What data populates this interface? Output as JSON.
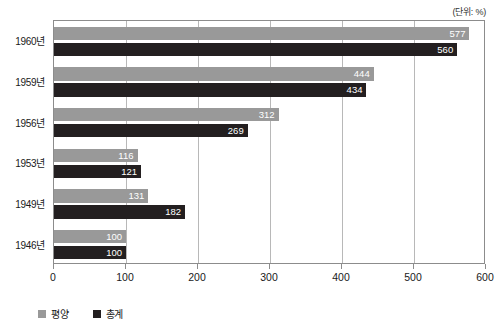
{
  "chart_data": {
    "type": "bar",
    "orientation": "horizontal",
    "title": "",
    "unit_note": "(단위: %)",
    "xlabel": "",
    "ylabel": "",
    "xlim": [
      0,
      600
    ],
    "xticks": [
      0,
      100,
      200,
      300,
      400,
      500,
      600
    ],
    "xtick_labels": [
      "0",
      "100",
      "200",
      "300",
      "400",
      "500",
      "600"
    ],
    "categories": [
      "1960년",
      "1959년",
      "1956년",
      "1953년",
      "1949년",
      "1946년"
    ],
    "grid": true,
    "legend_position": "bottom-left",
    "series": [
      {
        "name": "평양",
        "color": "#999999",
        "values": [
          577,
          444,
          312,
          116,
          131,
          100
        ],
        "labels": [
          "577",
          "444",
          "312",
          "116",
          "131",
          "100"
        ]
      },
      {
        "name": "총계",
        "color": "#231f20",
        "values": [
          560,
          434,
          269,
          121,
          182,
          100
        ],
        "labels": [
          "560",
          "434",
          "269",
          "121",
          "182",
          "100"
        ]
      }
    ]
  }
}
